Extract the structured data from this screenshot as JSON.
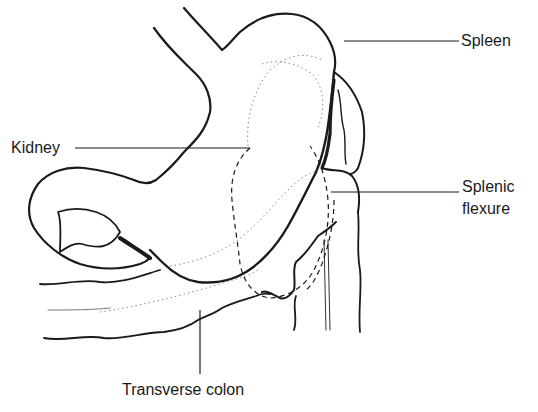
{
  "diagram": {
    "labels": {
      "spleen": "Spleen",
      "kidney": "Kidney",
      "splenic_flexure_line1": "Splenic",
      "splenic_flexure_line2": "flexure",
      "transverse_colon": "Transverse colon"
    },
    "colors": {
      "ink": "#1a1a1a",
      "background": "#ffffff",
      "dotted": "#8a8a8a"
    }
  }
}
